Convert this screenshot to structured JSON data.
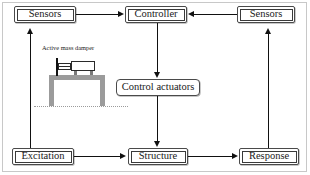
{
  "diagram": {
    "nodes": {
      "sensors_left": "Sensors",
      "controller": "Controller",
      "sensors_right": "Sensors",
      "control_actuators": "Control actuators",
      "excitation": "Excitation",
      "structure": "Structure",
      "response": "Response"
    },
    "illustration": {
      "caption": "Active mass damper"
    },
    "edges": [
      {
        "from": "Sensors",
        "to": "Controller",
        "direction": "right"
      },
      {
        "from": "Sensors",
        "to": "Controller",
        "direction": "left"
      },
      {
        "from": "Controller",
        "to": "Control actuators",
        "direction": "down"
      },
      {
        "from": "Control actuators",
        "to": "Structure",
        "direction": "down"
      },
      {
        "from": "Excitation",
        "to": "Structure",
        "direction": "right"
      },
      {
        "from": "Structure",
        "to": "Response",
        "direction": "right"
      },
      {
        "from": "Excitation",
        "to": "Sensors",
        "direction": "up"
      },
      {
        "from": "Response",
        "to": "Sensors",
        "direction": "up"
      }
    ],
    "colors": {
      "line": "#111111",
      "box_border": "#4a4a4a",
      "frame_gray": "#9b9b9b",
      "background": "#ffffff"
    }
  }
}
